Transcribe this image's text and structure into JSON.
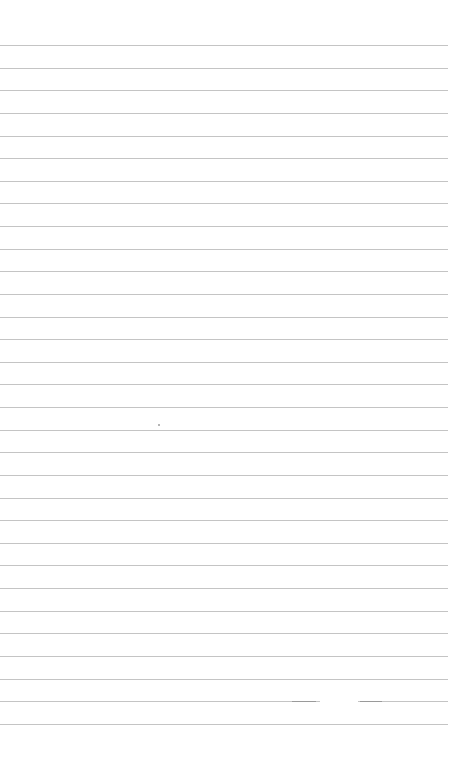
{
  "page": {
    "type": "lined-paper",
    "background_color": "#ffffff",
    "rule_color": "#c4c4c4",
    "rule_count": 31,
    "first_rule_y": 45,
    "rule_spacing": 22.63,
    "rule_width": 448,
    "broken_rule": {
      "index": 29,
      "gap_start_x": 320,
      "gap_end_x": 358
    },
    "marks": [
      {
        "name": "stray-dot",
        "x": 158,
        "y": 424
      }
    ]
  }
}
